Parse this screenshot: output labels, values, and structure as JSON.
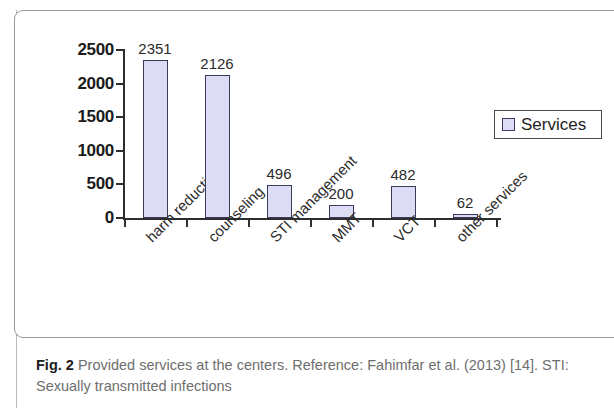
{
  "figure": {
    "caption_prefix": "Fig. 2",
    "caption_text": " Provided services at the centers. Reference: Fahimfar et al. (2013) [14]. STI: Sexually transmitted infections"
  },
  "legend": {
    "entries": [
      {
        "label": "Services",
        "color": "#dcdcf4"
      }
    ]
  },
  "axis": {
    "y_ticks": [
      "0",
      "500",
      "1000",
      "1500",
      "2000",
      "2500"
    ]
  },
  "chart_data": {
    "type": "bar",
    "title": "",
    "xlabel": "",
    "ylabel": "",
    "ylim": [
      0,
      2500
    ],
    "ytick_interval": 500,
    "grid": false,
    "legend_position": "right",
    "series_name": "Services",
    "bar_color": "#dcdcf4",
    "bar_border_color": "#3a3a5c",
    "categories": [
      "harm reduction",
      "counseling",
      "STI management",
      "MMT",
      "VCT",
      "other services"
    ],
    "values": [
      2351,
      2126,
      496,
      200,
      482,
      62
    ],
    "data_labels": [
      "2351",
      "2126",
      "496",
      "200",
      "482",
      "62"
    ]
  }
}
